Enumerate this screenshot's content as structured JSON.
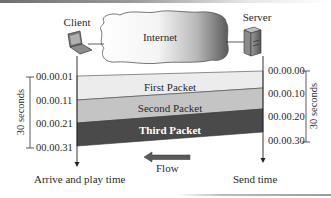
{
  "diagram": {
    "client_label": "Client",
    "server_label": "Server",
    "cloud_label": "Internet",
    "packets": [
      {
        "label": "First Packet",
        "color": "#ececec",
        "text_color": "#2a2a2a"
      },
      {
        "label": "Second Packet",
        "color": "#c4c4c4",
        "text_color": "#2a2a2a"
      },
      {
        "label": "Third Packet",
        "color": "#4a4a4a",
        "text_color": "#ffffff"
      }
    ],
    "client_times": [
      "00.00.01",
      "00.00.11",
      "00.00.21",
      "00.00.31"
    ],
    "server_times": [
      "00.00.00",
      "00.00.10",
      "00.00.20",
      "00.00.30"
    ],
    "left_span_label": "30 seconds",
    "right_span_label": "30 seconds",
    "flow_label": "Flow",
    "client_axis_label": "Arrive and play time",
    "server_axis_label": "Send time"
  }
}
